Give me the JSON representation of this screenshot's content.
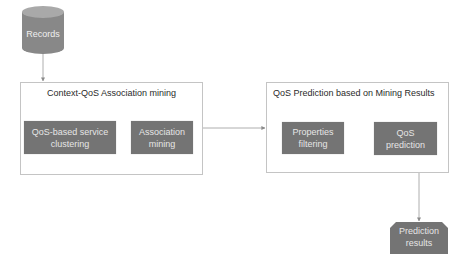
{
  "diagram": {
    "type": "flowchart",
    "colors": {
      "node_fill": "#747474",
      "node_text": "#e6e6e6",
      "cylinder_body": "#888888",
      "cylinder_top": "#a9a9a9",
      "group_border": "#c4c4c4",
      "group_title_text": "#2a2a2a",
      "connector": "#9a9a9a"
    },
    "source": {
      "label": "Records",
      "shape": "cylinder"
    },
    "groups": [
      {
        "title": "Context-QoS Association mining",
        "steps": [
          {
            "label": "QoS-based service clustering"
          },
          {
            "label": "Association mining"
          }
        ]
      },
      {
        "title": "QoS Prediction based on Mining Results",
        "steps": [
          {
            "label": "Properties filtering"
          },
          {
            "label": "QoS prediction"
          }
        ]
      }
    ],
    "output": {
      "label": "Prediction results",
      "shape": "snipped-rectangle"
    },
    "edges": [
      {
        "from": "Records",
        "to": "Context-QoS Association mining"
      },
      {
        "from": "Context-QoS Association mining",
        "to": "QoS Prediction based on Mining Results"
      },
      {
        "from": "QoS Prediction based on Mining Results",
        "to": "Prediction results"
      }
    ]
  }
}
